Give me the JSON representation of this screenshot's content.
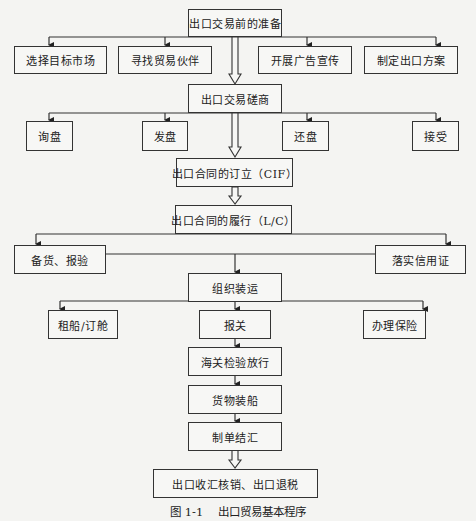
{
  "diagram": {
    "nodes": {
      "prep": "出口交易前的准备",
      "prep_children": [
        "选择目标市场",
        "寻找贸易伙伴",
        "开展广告宣传",
        "制定出口方案"
      ],
      "negotiate": "出口交易磋商",
      "negotiate_children": [
        "询盘",
        "发盘",
        "还盘",
        "接受"
      ],
      "contract_sign": "出口合同的订立（CIF）",
      "contract_perform": "出口合同的履行（L/C）",
      "perform_children": [
        "备货、报验",
        "落实信用证"
      ],
      "shipping": "组织装运",
      "shipping_children": [
        "租船/订舱",
        "报关",
        "办理保险"
      ],
      "customs_release": "海关检验放行",
      "loading": "货物装船",
      "settlement": "制单结汇",
      "final": "出口收汇核销、出口退税"
    },
    "caption": "图 1-1　 出口贸易基本程序"
  }
}
